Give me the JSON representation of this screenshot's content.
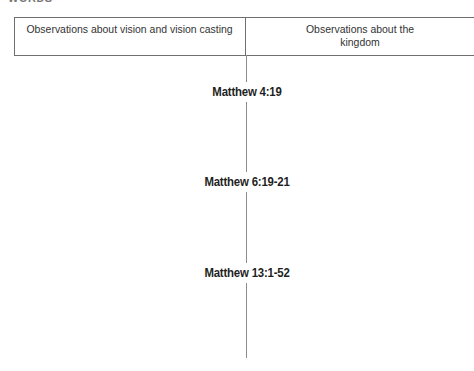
{
  "page": {
    "background": "#ffffff",
    "clipped_heading_fragment": "WORDS"
  },
  "table": {
    "border_color": "#6f6f6f",
    "columns": [
      {
        "header": "Observations about vision and vision casting"
      },
      {
        "header": "Observations about the kingdom"
      }
    ]
  },
  "timeline": {
    "line_color": "#8c8c8c",
    "labels": [
      "Matthew 4:19",
      "Matthew 6:19-21",
      "Matthew 13:1-52"
    ]
  },
  "colors": {
    "text": "#2e2e2e",
    "label_text": "#1f1f1f"
  }
}
